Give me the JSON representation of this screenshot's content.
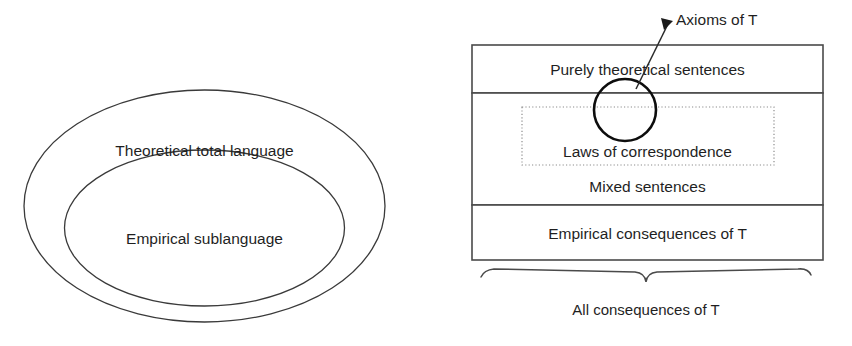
{
  "figure": {
    "background_color": "#ffffff",
    "line_color": "#4a4a4a",
    "text_color": "#1f1f1f",
    "accent_color": "#0d0d0d"
  },
  "left_diagram": {
    "name": "nested-ellipses",
    "outer_label": "Theoretical total language",
    "inner_label": "Empirical sublanguage"
  },
  "right_diagram": {
    "name": "stacked-consequence-bands",
    "rows": [
      {
        "label": "Purely theoretical sentences"
      },
      {
        "label": "Mixed sentences"
      },
      {
        "label": "Empirical consequences of T"
      }
    ],
    "dotted_region_label": "Laws of correspondence",
    "circle_callout_label": "Axioms of T",
    "brace_label": "All consequences of T"
  }
}
